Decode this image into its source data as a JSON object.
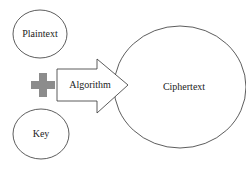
{
  "diagram": {
    "nodes": {
      "plaintext": {
        "label": "Plaintext"
      },
      "key": {
        "label": "Key"
      },
      "algorithm": {
        "label": "Algorithm"
      },
      "ciphertext": {
        "label": "Ciphertext"
      }
    },
    "operator": {
      "icon": "plus-icon",
      "color": "#8c8c8c"
    },
    "colors": {
      "stroke": "#333333",
      "fill": "#ffffff",
      "text": "#222222"
    }
  }
}
